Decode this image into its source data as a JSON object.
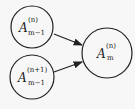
{
  "diagram": {
    "nodes": [
      {
        "id": "a_top",
        "base": "A",
        "sup": "(n)",
        "sub": "m−1",
        "cx": 32,
        "cy": 27,
        "r": 21
      },
      {
        "id": "a_bottom",
        "base": "A",
        "sup": "(n+1)",
        "sub": "m−1",
        "cx": 32,
        "cy": 77,
        "r": 22
      },
      {
        "id": "a_right",
        "base": "A",
        "sup": "(n)",
        "sub": "m",
        "cx": 107,
        "cy": 53,
        "r": 25
      }
    ],
    "edges": [
      {
        "from": "a_top",
        "to": "a_right"
      },
      {
        "from": "a_bottom",
        "to": "a_right"
      }
    ],
    "colors": {
      "stroke": "#222222",
      "background": "#f7f7f7"
    }
  }
}
